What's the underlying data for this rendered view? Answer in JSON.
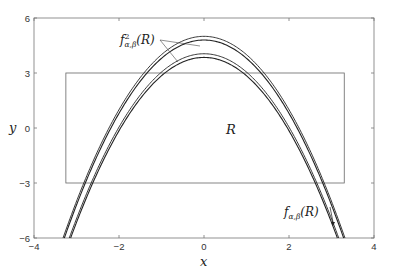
{
  "chart_data": {
    "type": "line",
    "title": "",
    "xlabel": "x",
    "ylabel": "y",
    "xlim": [
      -4,
      4
    ],
    "ylim": [
      -6,
      6
    ],
    "xticks": [
      -4,
      -2,
      0,
      2,
      4
    ],
    "yticks": [
      -6,
      -3,
      0,
      3,
      6
    ],
    "xtick_labels": [
      "−4",
      "−2",
      "0",
      "2",
      "4"
    ],
    "ytick_labels": [
      "−6",
      "−3",
      "0",
      "3",
      "6"
    ],
    "grid": false,
    "legend": null,
    "rectangle": {
      "name": "R",
      "label": "R",
      "x": [
        -3.25,
        3.3
      ],
      "y": [
        -3,
        3
      ]
    },
    "series": [
      {
        "name": "f²α,β(R) outer",
        "form": "y = 5.0 - x^2",
        "peak": 5.0,
        "group": "f2"
      },
      {
        "name": "f²α,β(R) inner",
        "form": "y = 4.8 - x^2",
        "peak": 4.8,
        "group": "f2"
      },
      {
        "name": "fα,β(R) outer",
        "form": "y = 4.05 - x^2",
        "peak": 4.05,
        "group": "f1"
      },
      {
        "name": "fα,β(R) inner",
        "form": "y = 3.85 - x^2",
        "peak": 3.85,
        "group": "f1"
      }
    ],
    "annotations": [
      {
        "text": "f²α,β(R)",
        "x": -1.6,
        "y": 4.8,
        "arrows_to": [
          [
            -0.8,
            4.2
          ],
          [
            -0.6,
            3.6
          ]
        ]
      },
      {
        "text": "fα,β(R)",
        "x": 2.1,
        "y": -4.6,
        "arrows_to": [
          [
            3.0,
            -4.8
          ]
        ]
      },
      {
        "text": "R",
        "x": 0.0,
        "y": 0.0
      }
    ]
  },
  "labels": {
    "x_axis": "x",
    "y_axis": "y",
    "region": "R",
    "f2_base": "f",
    "f2_sup": "2",
    "f2_sub": "α,β",
    "f2_arg": "(R)",
    "f1_base": "f",
    "f1_sub": "α,β",
    "f1_arg": "(R)"
  }
}
